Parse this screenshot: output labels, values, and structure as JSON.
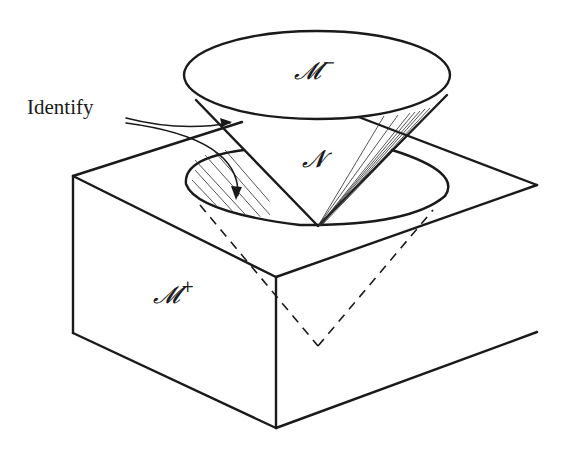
{
  "figure": {
    "labels": {
      "top_region": {
        "base": "𝓜",
        "sup": "−"
      },
      "cone": {
        "base": "𝓝"
      },
      "box_region": {
        "base": "𝓜",
        "sup": "+"
      },
      "identify": "Identify"
    },
    "colors": {
      "line": "#1a1a1a",
      "background": "#ffffff"
    }
  }
}
